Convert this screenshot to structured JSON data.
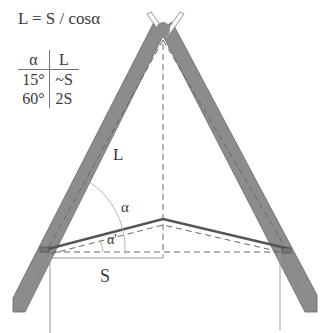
{
  "formula": "L = S / cosα",
  "table": {
    "headers": [
      "α",
      "L"
    ],
    "rows": [
      [
        "15°",
        "~S"
      ],
      [
        "60°",
        "2S"
      ]
    ]
  },
  "labels": {
    "rafter_length": "L",
    "angle_alpha": "α",
    "angle_alpha_prime": "α'",
    "span": "S"
  },
  "colors": {
    "rafter_fill": "#8c8c8c",
    "line": "#555555",
    "dashed": "#666666",
    "thin": "#999999",
    "background": "#ffffff"
  }
}
